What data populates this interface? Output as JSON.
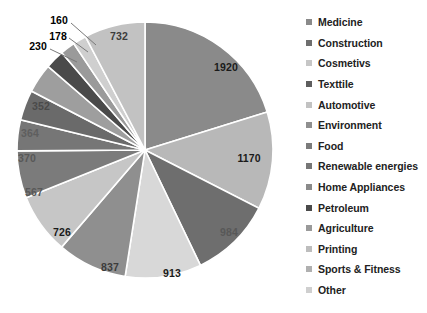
{
  "chart_data": {
    "type": "pie",
    "title": "",
    "subtitle": "",
    "xlabel": "",
    "ylabel": "",
    "legend_position": "right",
    "grid": false,
    "total": 9373,
    "categories": [
      "Medicine",
      "Construction",
      "Cosmetivs",
      "Texttile",
      "Automotive",
      "Environment",
      "Food",
      "Renewable energies",
      "Home Appliances",
      "Petroleum",
      "Agriculture",
      "Printing",
      "Sports & Fitness",
      "Other"
    ],
    "values": [
      1920,
      1170,
      984,
      913,
      837,
      726,
      567,
      370,
      364,
      352,
      230,
      178,
      160,
      732
    ],
    "colors": [
      "#8a8a8a",
      "#b8b8b8",
      "#6e6e6e",
      "#d8d8d8",
      "#8f8f8f",
      "#c6c6c6",
      "#7b7b7b",
      "#767676",
      "#6a6a6a",
      "#9e9e9e",
      "#4a4a4a",
      "#9a9a9a",
      "#cfcfcf",
      "#c2c2c2"
    ],
    "slices": [
      {
        "label": "Medicine",
        "value": 1920,
        "value_text": "1920",
        "color": "#8a8a8a",
        "label_color": "#1a1a1a",
        "label_placement": "inside",
        "lx": 226,
        "ly": 67
      },
      {
        "label": "Construction",
        "value": 1170,
        "value_text": "1170",
        "color": "#b8b8b8",
        "label_color": "#1a1a1a",
        "label_placement": "inside",
        "lx": 249,
        "ly": 158
      },
      {
        "label": "Cosmetivs",
        "value": 984,
        "value_text": "984",
        "color": "#6e6e6e",
        "label_color": "#585858",
        "label_placement": "inside",
        "lx": 229,
        "ly": 232
      },
      {
        "label": "Texttile",
        "value": 913,
        "value_text": "913",
        "color": "#d8d8d8",
        "label_color": "#1a1a1a",
        "label_placement": "inside",
        "lx": 172,
        "ly": 273
      },
      {
        "label": "Automotive",
        "value": 837,
        "value_text": "837",
        "color": "#8f8f8f",
        "label_color": "#3c3c3c",
        "label_placement": "inside",
        "lx": 110,
        "ly": 267
      },
      {
        "label": "Environment",
        "value": 726,
        "value_text": "726",
        "color": "#c6c6c6",
        "label_color": "#1a1a1a",
        "label_placement": "inside",
        "lx": 62,
        "ly": 232
      },
      {
        "label": "Food",
        "value": 567,
        "value_text": "567",
        "color": "#7b7b7b",
        "label_color": "#585858",
        "label_placement": "inside",
        "lx": 34,
        "ly": 192
      },
      {
        "label": "Renewable energies",
        "value": 370,
        "value_text": "370",
        "color": "#767676",
        "label_color": "#585858",
        "label_placement": "inside",
        "lx": 27,
        "ly": 158
      },
      {
        "label": "Home Appliances",
        "value": 364,
        "value_text": "364",
        "color": "#6a6a6a",
        "label_color": "#5e5e5e",
        "label_placement": "inside",
        "lx": 30,
        "ly": 133
      },
      {
        "label": "Petroleum",
        "value": 352,
        "value_text": "352",
        "color": "#9e9e9e",
        "label_color": "#4a4a4a",
        "label_placement": "inside",
        "lx": 41,
        "ly": 106
      },
      {
        "label": "Agriculture",
        "value": 230,
        "value_text": "230",
        "color": "#4a4a4a",
        "label_color": "#000000",
        "label_placement": "outside",
        "lx": 38,
        "ly": 46,
        "leader": {
          "x1": 50,
          "y1": 49,
          "x2": 77,
          "y2": 62
        }
      },
      {
        "label": "Printing",
        "value": 178,
        "value_text": "178",
        "color": "#9a9a9a",
        "label_color": "#000000",
        "label_placement": "outside",
        "lx": 58,
        "ly": 36,
        "leader": {
          "x1": 69,
          "y1": 38,
          "x2": 88,
          "y2": 52
        }
      },
      {
        "label": "Sports & Fitness",
        "value": 160,
        "value_text": "160",
        "color": "#cfcfcf",
        "label_color": "#000000",
        "label_placement": "outside",
        "lx": 59,
        "ly": 20,
        "leader": {
          "x1": 71,
          "y1": 23,
          "x2": 96,
          "y2": 45
        }
      },
      {
        "label": "Other",
        "value": 732,
        "value_text": "732",
        "color": "#c2c2c2",
        "label_color": "#3c3c3c",
        "label_placement": "inside",
        "lx": 119,
        "ly": 36
      }
    ],
    "geometry": {
      "cx": 145,
      "cy": 150,
      "r": 128,
      "start_angle_deg": 0,
      "direction": "clockwise"
    }
  },
  "legend": {
    "items": [
      {
        "label": "Medicine",
        "color": "#8a8a8a"
      },
      {
        "label": "Construction",
        "color": "#6e6e6e"
      },
      {
        "label": "Cosmetivs",
        "color": "#c6c6c6"
      },
      {
        "label": "Texttile",
        "color": "#5e5e5e"
      },
      {
        "label": "Automotive",
        "color": "#c2c2c2"
      },
      {
        "label": "Environment",
        "color": "#8f8f8f"
      },
      {
        "label": "Food",
        "color": "#7b7b7b"
      },
      {
        "label": "Renewable energies",
        "color": "#767676"
      },
      {
        "label": "Home Appliances",
        "color": "#8a8a8a"
      },
      {
        "label": "Petroleum",
        "color": "#4a4a4a"
      },
      {
        "label": "Agriculture",
        "color": "#9a9a9a"
      },
      {
        "label": "Printing",
        "color": "#bdbdbd"
      },
      {
        "label": "Sports & Fitness",
        "color": "#b0b0b0"
      },
      {
        "label": "Other",
        "color": "#cfcfcf"
      }
    ]
  }
}
